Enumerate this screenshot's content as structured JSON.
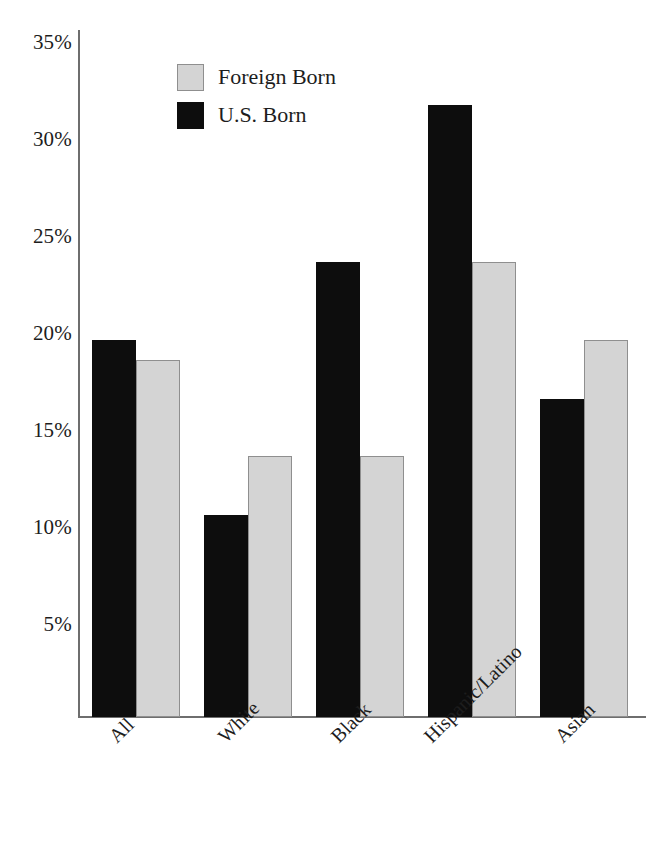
{
  "chart_data": {
    "type": "bar",
    "title": "",
    "subtitle": "",
    "xlabel": "",
    "ylabel": "",
    "categories": [
      "All",
      "White",
      "Black",
      "Hispanic/Latino",
      "Asian"
    ],
    "series": [
      {
        "name": "Foreign Born",
        "color": "#d4d4d4",
        "values": [
          18.2,
          13.3,
          13.3,
          23.2,
          19.2
        ]
      },
      {
        "name": "U.S. Born",
        "color": "#0d0d0d",
        "values": [
          19.2,
          10.3,
          23.2,
          31.2,
          16.2
        ]
      }
    ],
    "series_draw_order": [
      "U.S. Born",
      "Foreign Born"
    ],
    "ylim": [
      0,
      35
    ],
    "yticks": [
      5,
      10,
      15,
      20,
      25,
      30,
      35
    ],
    "ytick_labels": [
      "5%",
      "10%",
      "15%",
      "20%",
      "25%",
      "30%",
      "35%"
    ],
    "grid": false,
    "legend_position": "top-left-inside",
    "xtick_rotation_deg": -45,
    "value_suffix": "%"
  },
  "legend": {
    "items": [
      {
        "label": "Foreign Born",
        "swatch": "fb"
      },
      {
        "label": "U.S. Born",
        "swatch": "us"
      }
    ]
  },
  "axis": {
    "y_tick_labels": [
      "35%",
      "30%",
      "25%",
      "20%",
      "15%",
      "10%",
      "5%"
    ],
    "x_tick_labels": [
      "All",
      "White",
      "Black",
      "Hispanic/Latino",
      "Asian"
    ]
  }
}
